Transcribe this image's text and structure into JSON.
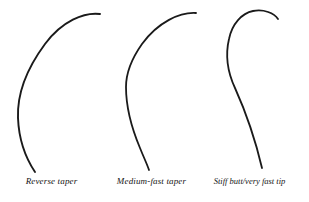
{
  "figure": {
    "background_color": "#ffffff",
    "stroke_color": "#1a1a1a",
    "width": 309,
    "height": 202
  },
  "panels": [
    {
      "id": "reverse-taper",
      "caption": "Reverse taper",
      "stroke_width": 1.9,
      "path": "M 100 14 C 84 12 62 21 45 44 C 28 67 17 93 18 118 C 19 143 27 160 35 172"
    },
    {
      "id": "medium-fast-taper",
      "caption": "Medium-fast taper",
      "stroke_width": 1.8,
      "path": "M 96 13 C 80 12 58 22 42 44 C 30 61 26 74 26 87 C 26 106 32 129 40 148 C 44 158 47 164 49 170"
    },
    {
      "id": "stiff-butt-very-fast-tip",
      "caption": "Stiff butt/very fast tip",
      "stroke_width": 1.8,
      "path": "M 80 19 C 76 13 66 9 55 11 C 44 13 34 24 31 39 C 27 56 30 73 37 88 C 46 108 56 134 64 168"
    }
  ],
  "chart_data": {
    "type": "line",
    "xlabel": "",
    "ylabel": "",
    "series": [
      {
        "name": "Reverse taper",
        "description": "Smooth even arc bending through the whole blank",
        "tip_point": [
          100,
          14
        ],
        "butt_point": [
          35,
          172
        ],
        "leftmost_x": 17
      },
      {
        "name": "Medium-fast taper",
        "description": "Bend concentrated in upper third, straighter butt",
        "tip_point": [
          96,
          13
        ],
        "butt_point": [
          49,
          170
        ],
        "leftmost_x": 26
      },
      {
        "name": "Stiff butt/very fast tip",
        "description": "Sharp hook at the tip with an almost straight stiff butt",
        "tip_point": [
          80,
          19
        ],
        "butt_point": [
          64,
          168
        ],
        "leftmost_x": 29
      }
    ],
    "legend": "none",
    "grid": false
  }
}
